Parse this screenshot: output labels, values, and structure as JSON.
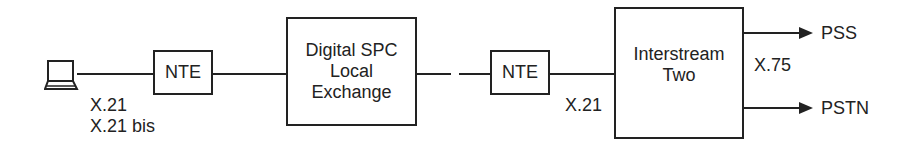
{
  "diagram": {
    "nodes": [
      {
        "id": "terminal",
        "label": "",
        "icon": "terminal-icon"
      },
      {
        "id": "nte1",
        "label": "NTE"
      },
      {
        "id": "exchange",
        "label": "Digital SPC\nLocal\nExchange"
      },
      {
        "id": "nte2",
        "label": "NTE"
      },
      {
        "id": "interstream",
        "label": "Interstream\nTwo"
      }
    ],
    "edges": [
      {
        "from": "terminal",
        "to": "nte1"
      },
      {
        "from": "nte1",
        "to": "exchange"
      },
      {
        "from": "exchange",
        "to": "nte2"
      },
      {
        "from": "nte2",
        "to": "interstream"
      },
      {
        "from": "interstream",
        "to": "PSS",
        "arrow": true
      },
      {
        "from": "interstream",
        "to": "PSTN",
        "arrow": true
      }
    ],
    "labels": {
      "terminal_interface": "X.21\nX.21 bis",
      "nte2_interface": "X.21",
      "interstream_interface": "X.75",
      "pss": "PSS",
      "pstn": "PSTN"
    }
  }
}
